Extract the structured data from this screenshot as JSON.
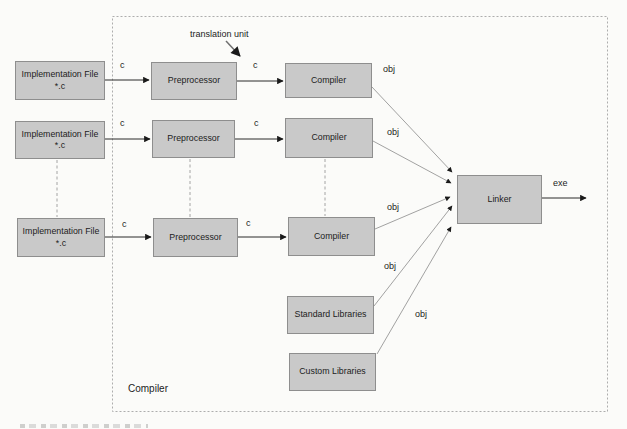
{
  "diagram_title_group": {
    "label": "Compiler"
  },
  "annotation": {
    "translation_unit": "translation unit"
  },
  "nodes": {
    "impl_file_1": {
      "title": "Implementation File",
      "subtitle": "*.c"
    },
    "impl_file_2": {
      "title": "Implementation File",
      "subtitle": "*.c"
    },
    "impl_file_3": {
      "title": "Implementation File",
      "subtitle": "*.c"
    },
    "preprocessor_1": {
      "title": "Preprocessor"
    },
    "preprocessor_2": {
      "title": "Preprocessor"
    },
    "preprocessor_3": {
      "title": "Preprocessor"
    },
    "compiler_1": {
      "title": "Compiler"
    },
    "compiler_2": {
      "title": "Compiler"
    },
    "compiler_3": {
      "title": "Compiler"
    },
    "standard_libraries": {
      "title": "Standard Libraries"
    },
    "custom_libraries": {
      "title": "Custom Libraries"
    },
    "linker": {
      "title": "Linker"
    }
  },
  "edge_labels": {
    "c_row1_src": "c",
    "c_row1_tu": "c",
    "c_row2_src": "c",
    "c_row2_pre": "c",
    "c_row3_src": "c",
    "c_row3_pre": "c",
    "obj_compiler1": "obj",
    "obj_compiler2": "obj",
    "obj_compiler3": "obj",
    "obj_standard_libraries": "obj",
    "obj_custom_libraries": "obj",
    "exe": "exe"
  },
  "colors": {
    "node_fill": "#c9c9c9",
    "node_border": "#8e8e8e",
    "background": "#fbfbf9",
    "arrow": "#2a2a2a",
    "thin_line": "#8a8a8a",
    "dashed_border": "#adadad",
    "text": "#1c1c1c"
  }
}
